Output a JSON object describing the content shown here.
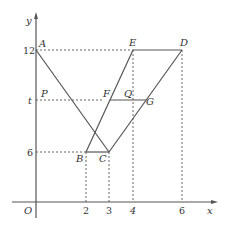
{
  "figure": {
    "type": "coordinate geometry diagram",
    "axes": {
      "x_label": "x",
      "y_label": "y",
      "origin_label": "O"
    },
    "x_ticks": [
      "2",
      "3",
      "4",
      "6"
    ],
    "y_ticks": [
      "12",
      "t",
      "6"
    ],
    "points": {
      "A": {
        "label": "A",
        "x": 0,
        "y": 12
      },
      "B": {
        "label": "B",
        "x": 2,
        "y": 6
      },
      "C": {
        "label": "C",
        "x": 3,
        "y": 6
      },
      "D": {
        "label": "D",
        "x": 6,
        "y": 12
      },
      "E": {
        "label": "E",
        "x": 4,
        "y": 12
      },
      "F": {
        "label": "F",
        "y": "t"
      },
      "G": {
        "label": "G",
        "y": "t"
      },
      "P": {
        "label": "P",
        "x": 0,
        "y": "t"
      },
      "Q": {
        "label": "Q",
        "x": 4,
        "y": "t"
      }
    },
    "segments": [
      "AC",
      "BE",
      "CD",
      "ED",
      "BC",
      "FG"
    ],
    "dashed_guides": [
      "y=12 from A to E",
      "y=t from P to F",
      "y=6 to B",
      "x=2 from B",
      "x=3 from C",
      "x=4 from E",
      "x=6 from D"
    ],
    "colors": {
      "line": "#555555",
      "text": "#333333",
      "background": "#ffffff"
    }
  }
}
